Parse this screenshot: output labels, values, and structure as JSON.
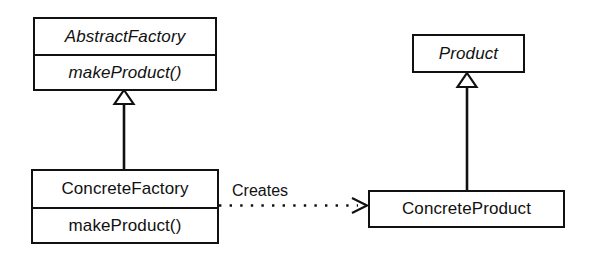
{
  "diagram": {
    "kind": "uml-class-diagram",
    "colors": {
      "background": "#ffffff",
      "stroke": "#111111",
      "fill": "#ffffff",
      "text": "#111111"
    },
    "classes": [
      {
        "id": "abstract-factory",
        "name": "AbstractFactory",
        "abstract": true,
        "operations": [
          "makeProduct()"
        ]
      },
      {
        "id": "concrete-factory",
        "name": "ConcreteFactory",
        "abstract": false,
        "operations": [
          "makeProduct()"
        ]
      },
      {
        "id": "product",
        "name": "Product",
        "abstract": true,
        "operations": []
      },
      {
        "id": "concrete-product",
        "name": "ConcreteProduct",
        "abstract": false,
        "operations": []
      }
    ],
    "relationships": [
      {
        "id": "factory-generalization",
        "type": "generalization",
        "from": "ConcreteFactory",
        "to": "AbstractFactory",
        "label": "",
        "line": "solid",
        "arrowhead": "hollow-triangle"
      },
      {
        "id": "product-generalization",
        "type": "generalization",
        "from": "ConcreteProduct",
        "to": "Product",
        "label": "",
        "line": "solid",
        "arrowhead": "hollow-triangle"
      },
      {
        "id": "creates-dependency",
        "type": "dependency",
        "from": "ConcreteFactory",
        "to": "ConcreteProduct",
        "label": "Creates",
        "line": "dotted",
        "arrowhead": "open"
      }
    ]
  }
}
